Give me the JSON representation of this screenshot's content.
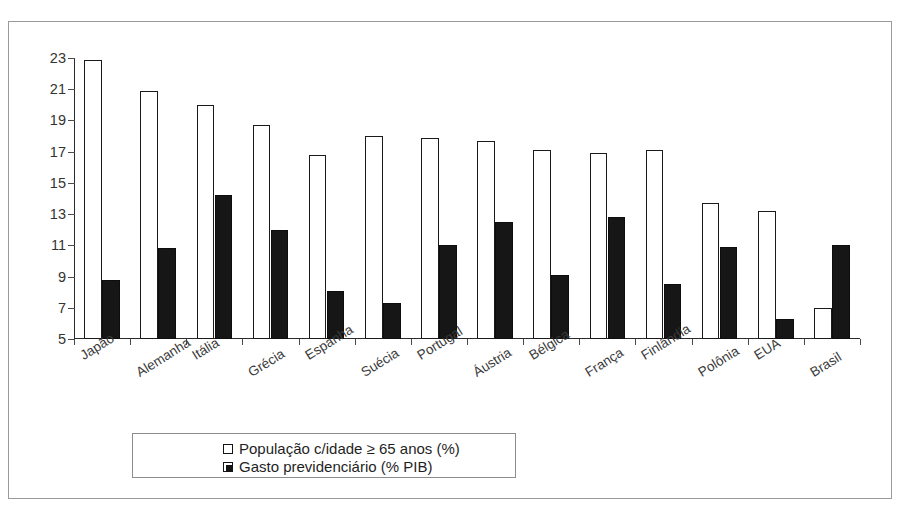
{
  "chart_data": {
    "type": "bar",
    "title": "",
    "subtitle": "",
    "xlabel": "",
    "ylabel": "",
    "ylim": [
      5,
      23
    ],
    "ytick_step": 2,
    "yticks": [
      23,
      21,
      19,
      17,
      15,
      13,
      11,
      9,
      7,
      5
    ],
    "grid": false,
    "legend_position": "bottom-center",
    "categories": [
      "Japão",
      "Alemanha",
      "Itália",
      "Grécia",
      "Espanha",
      "Suécia",
      "Portugal",
      "Áustria",
      "Bélgica",
      "França",
      "Finlândia",
      "Polônia",
      "EUA",
      "Brasil"
    ],
    "series": [
      {
        "name": "População c/idade ≥ 65 anos (%)",
        "style": "white",
        "color": "#ffffff",
        "edge_color": "#1a1a1a",
        "values": [
          22.9,
          20.9,
          20.0,
          18.7,
          16.8,
          18.0,
          17.9,
          17.7,
          17.1,
          16.9,
          17.1,
          13.7,
          13.2,
          7.0
        ]
      },
      {
        "name": "Gasto previdenciário (% PIB)",
        "style": "filled",
        "color": "#161616",
        "edge_color": "#0d0d0d",
        "values": [
          8.8,
          10.8,
          14.2,
          12.0,
          8.1,
          7.3,
          11.0,
          12.5,
          9.1,
          12.8,
          8.5,
          10.9,
          6.3,
          11.0
        ]
      }
    ]
  },
  "legend": {
    "items": [
      {
        "label": "População c/idade ≥ 65 anos (%)",
        "swatch": "white-square-icon"
      },
      {
        "label": "Gasto previdenciário (% PIB)",
        "swatch": "black-square-icon"
      }
    ]
  },
  "colors": {
    "background": "#ffffff",
    "frame": "#9a9a9a",
    "axis": "#2b2b2b",
    "tick_label": "#333333",
    "series_white": "#ffffff",
    "series_black": "#161616"
  }
}
